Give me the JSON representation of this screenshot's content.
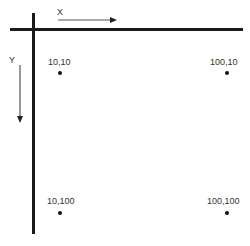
{
  "diagram": {
    "axes": {
      "x_label": "X",
      "y_label": "Y"
    },
    "points": [
      {
        "label": "10,10"
      },
      {
        "label": "100,10"
      },
      {
        "label": "10,100"
      },
      {
        "label": "100,100"
      }
    ],
    "colors": {
      "line": "#1a1a1a",
      "arrow": "#555555",
      "dot": "#111111"
    }
  }
}
